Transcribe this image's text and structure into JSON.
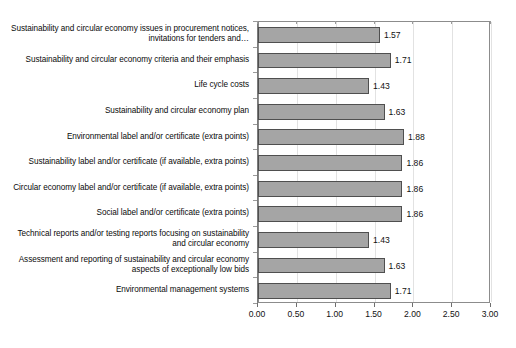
{
  "chart_data": {
    "type": "bar",
    "orientation": "horizontal",
    "title": "",
    "subtitle": "",
    "xlabel": "",
    "ylabel": "",
    "xlim": [
      0,
      3
    ],
    "xticks": [
      "0.00",
      "0.50",
      "1.00",
      "1.50",
      "2.00",
      "2.50",
      "3.00"
    ],
    "xtick_values": [
      0,
      0.5,
      1.0,
      1.5,
      2.0,
      2.5,
      3.0
    ],
    "grid": "vertical",
    "legend": "none",
    "bar_fill_color": "#a5a5a5",
    "bar_border_color": "#4f4f4f",
    "gridline_color": "#e2e2e2",
    "frame_color": "#8c8c8c",
    "categories": [
      "Sustainability and circular economy issues in procurement notices, invitations for tenders and…",
      "Sustainability and circular economy criteria and their emphasis",
      "Life cycle costs",
      "Sustainability and circular economy plan",
      "Environmental label and/or certificate (extra points)",
      "Sustainability label and/or certificate (if available, extra points)",
      "Circular economy label and/or certificate (if available, extra points)",
      "Social label and/or certificate (extra points)",
      "Technical reports and/or testing reports focusing on sustainability and circular economy",
      "Assessment and reporting of sustainability and circular economy aspects of exceptionally low bids",
      "Environmental management systems"
    ],
    "values": [
      1.57,
      1.71,
      1.43,
      1.63,
      1.88,
      1.86,
      1.86,
      1.86,
      1.43,
      1.63,
      1.71
    ],
    "value_labels": [
      "1.57",
      "1.71",
      "1.43",
      "1.63",
      "1.88",
      "1.86",
      "1.86",
      "1.86",
      "1.43",
      "1.63",
      "1.71"
    ]
  }
}
